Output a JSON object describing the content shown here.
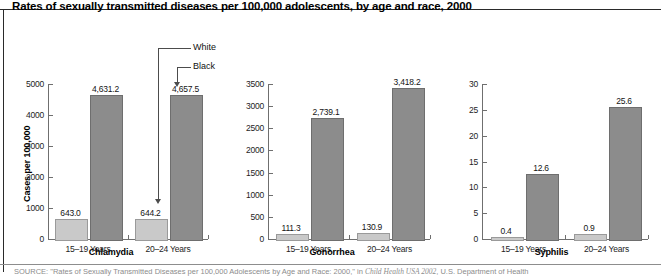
{
  "figure": {
    "title": "Rates of sexually transmitted diseases per 100,000 adolescents, by age and race, 2000",
    "source_prefix": "SOURCE:",
    "source_text_1": " \"Rates of Sexually Transmitted Diseases per 100,000 Adolescents by Age and Race: 2000,\" in ",
    "source_italic": "Child Health USA 2002",
    "source_text_2": ", U.S. Department of Health"
  },
  "annotations": {
    "white_label": "White",
    "black_label": "Black"
  },
  "axis": {
    "ylabel": "Cases per 100,000"
  },
  "chart_data": [
    {
      "type": "bar",
      "title": "Chlamydia",
      "xlabel": "",
      "ylabel": "Cases per 100,000",
      "categories": [
        "15–19 Years",
        "20–24 Years"
      ],
      "series": [
        {
          "name": "White",
          "values": [
            643.0,
            644.2
          ],
          "labels": [
            "643.0",
            "644.2"
          ],
          "color": "#c9c9c9"
        },
        {
          "name": "Black",
          "values": [
            4631.2,
            4657.5
          ],
          "labels": [
            "4,631.2",
            "4,657.5"
          ],
          "color": "#8c8c8c"
        }
      ],
      "ylim": [
        0,
        5000
      ],
      "yticks": [
        0,
        1000,
        2000,
        3000,
        4000,
        5000
      ],
      "ytick_labels": [
        "0",
        "1000",
        "2000",
        "3000",
        "4000",
        "5000"
      ],
      "grid": false,
      "legend": "callout-annotations"
    },
    {
      "type": "bar",
      "title": "Gonorrhea",
      "xlabel": "",
      "ylabel": "",
      "categories": [
        "15–19 Years",
        "20–24 Years"
      ],
      "series": [
        {
          "name": "White",
          "values": [
            111.3,
            130.9
          ],
          "labels": [
            "111.3",
            "130.9"
          ],
          "color": "#c9c9c9"
        },
        {
          "name": "Black",
          "values": [
            2739.1,
            3418.2
          ],
          "labels": [
            "2,739.1",
            "3,418.2"
          ],
          "color": "#8c8c8c"
        }
      ],
      "ylim": [
        0,
        3500
      ],
      "yticks": [
        0,
        500,
        1000,
        1500,
        2000,
        2500,
        3000,
        3500
      ],
      "ytick_labels": [
        "0",
        "500",
        "1000",
        "1500",
        "2000",
        "2500",
        "3000",
        "3500"
      ],
      "grid": false,
      "legend": "none"
    },
    {
      "type": "bar",
      "title": "Syphilis",
      "xlabel": "",
      "ylabel": "",
      "categories": [
        "15–19 Years",
        "20–24 Years"
      ],
      "series": [
        {
          "name": "White",
          "values": [
            0.4,
            0.9
          ],
          "labels": [
            "0.4",
            "0.9"
          ],
          "color": "#c9c9c9"
        },
        {
          "name": "Black",
          "values": [
            12.6,
            25.6
          ],
          "labels": [
            "12.6",
            "25.6"
          ],
          "color": "#8c8c8c"
        }
      ],
      "ylim": [
        0,
        30
      ],
      "yticks": [
        0,
        5,
        10,
        15,
        20,
        25,
        30
      ],
      "ytick_labels": [
        "0",
        "5",
        "10",
        "15",
        "20",
        "25",
        "30"
      ],
      "grid": false,
      "legend": "none"
    }
  ],
  "colors": {
    "white_race_bar": "#c9c9c9",
    "black_race_bar": "#8c8c8c",
    "axis": "#6f6f6f",
    "text": "#1a1a1a"
  }
}
